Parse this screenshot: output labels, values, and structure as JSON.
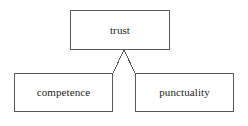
{
  "diagram": {
    "type": "tree",
    "background_color": "#ffffff",
    "stroke_color": "#555a5e",
    "text_color": "#1b1b1b",
    "nodes": [
      {
        "id": "trust",
        "label": "trust",
        "role": "root",
        "x": 70,
        "y": 10,
        "width": 100,
        "height": 40
      },
      {
        "id": "competence",
        "label": "competence",
        "role": "child",
        "x": 14,
        "y": 73,
        "width": 99,
        "height": 39
      },
      {
        "id": "punctuality",
        "label": "punctuality",
        "role": "child",
        "x": 135,
        "y": 73,
        "width": 99,
        "height": 39
      }
    ],
    "edges": [
      {
        "id": "trust-to-competence",
        "from": "trust",
        "to": "competence",
        "from_x": 124,
        "from_y": 50,
        "to_x": 113,
        "to_y": 73
      },
      {
        "id": "trust-to-punctuality",
        "from": "trust",
        "to": "punctuality",
        "from_x": 124,
        "from_y": 50,
        "to_x": 135,
        "to_y": 73
      }
    ]
  }
}
